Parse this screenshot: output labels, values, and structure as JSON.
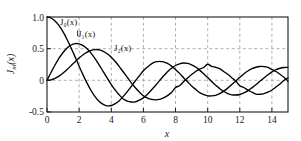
{
  "chart_data": {
    "type": "line",
    "title": "",
    "subtitle": "",
    "xlabel": "x",
    "ylabel": "J_m(x)",
    "xlim": [
      0,
      15
    ],
    "ylim": [
      -0.5,
      1.0
    ],
    "grid": true,
    "grid_style": "dashed",
    "legend": "inline-annotations",
    "xticks": [
      0,
      2,
      4,
      6,
      8,
      10,
      12,
      14
    ],
    "xticklabels": [
      "0",
      "2",
      "4",
      "6",
      "8",
      "10",
      "12",
      "14"
    ],
    "yticks": [
      -0.5,
      0,
      0.5,
      1.0
    ],
    "yticklabels": [
      "-0.5",
      "0",
      "0.5",
      "1.0"
    ],
    "x": [
      0,
      0.25,
      0.5,
      0.75,
      1,
      1.25,
      1.5,
      1.75,
      2,
      2.25,
      2.5,
      2.75,
      3,
      3.25,
      3.5,
      3.75,
      4,
      4.25,
      4.5,
      4.75,
      5,
      5.25,
      5.5,
      5.75,
      6,
      6.25,
      6.5,
      6.75,
      7,
      7.25,
      7.5,
      7.75,
      8,
      8.25,
      8.5,
      8.75,
      9,
      9.25,
      9.5,
      9.75,
      10,
      10.25,
      10.5,
      10.75,
      11,
      11.25,
      11.5,
      11.75,
      12,
      12.25,
      12.5,
      12.75,
      13,
      13.25,
      13.5,
      13.75,
      14,
      14.25,
      14.5,
      14.75,
      15
    ],
    "series": [
      {
        "name": "J0(x)",
        "label": "J₀(x)",
        "color": "#000000",
        "values": [
          1.0,
          0.9844,
          0.9385,
          0.8642,
          0.7652,
          0.6459,
          0.5118,
          0.369,
          0.2239,
          0.0827,
          -0.0484,
          -0.1641,
          -0.2601,
          -0.3337,
          -0.3801,
          -0.4026,
          -0.3971,
          -0.3665,
          -0.3205,
          -0.2526,
          -0.1776,
          -0.0968,
          -0.0068,
          0.0717,
          0.1506,
          0.2097,
          0.2601,
          0.2921,
          0.3001,
          0.2921,
          0.2663,
          0.2248,
          0.1717,
          0.1096,
          0.0419,
          -0.0232,
          -0.0903,
          -0.1424,
          -0.1939,
          -0.2243,
          -0.2459,
          -0.2459,
          -0.2366,
          -0.2097,
          -0.1712,
          -0.1231,
          -0.0677,
          -0.0093,
          0.0477,
          0.1015,
          0.1469,
          0.1838,
          0.2069,
          0.2184,
          0.2167,
          0.2029,
          0.1711,
          0.1392,
          0.0958,
          0.0471,
          -0.0142
        ]
      },
      {
        "name": "J1(x)",
        "label": "J₁(x)",
        "color": "#000000",
        "values": [
          0.0,
          0.124,
          0.2423,
          0.3492,
          0.4401,
          0.5106,
          0.5579,
          0.5802,
          0.5767,
          0.5484,
          0.4971,
          0.4258,
          0.3391,
          0.2403,
          0.1374,
          0.0339,
          -0.066,
          -0.1538,
          -0.2311,
          -0.2942,
          -0.3276,
          -0.3419,
          -0.3414,
          -0.311,
          -0.2767,
          -0.2196,
          -0.1538,
          -0.0819,
          -0.0047,
          0.0693,
          0.1352,
          0.1913,
          0.2346,
          0.261,
          0.2731,
          0.2668,
          0.2453,
          0.2099,
          0.1613,
          0.1041,
          0.0435,
          -0.0184,
          -0.0789,
          -0.131,
          -0.1768,
          -0.2088,
          -0.2284,
          -0.232,
          -0.2234,
          -0.1992,
          -0.1655,
          -0.1192,
          -0.0703,
          -0.0152,
          0.038,
          0.0874,
          0.1334,
          0.1687,
          0.1907,
          0.2028,
          0.2051
        ]
      },
      {
        "name": "J2(x)",
        "label": "J₂(x)",
        "color": "#000000",
        "values": [
          0.0,
          0.0078,
          0.0306,
          0.0673,
          0.1149,
          0.1711,
          0.2321,
          0.294,
          0.3528,
          0.405,
          0.4461,
          0.4739,
          0.4861,
          0.4813,
          0.4586,
          0.4193,
          0.3641,
          0.2969,
          0.2178,
          0.1318,
          0.0466,
          -0.0389,
          -0.1173,
          -0.1846,
          -0.2429,
          -0.2792,
          -0.3009,
          -0.3075,
          -0.3014,
          -0.2768,
          -0.2406,
          -0.1937,
          -0.113,
          -0.0849,
          -0.0237,
          0.0351,
          0.0917,
          0.1389,
          0.1768,
          0.2031,
          0.2546,
          0.2196,
          0.2066,
          0.1836,
          0.139,
          0.0953,
          0.0426,
          -0.0118,
          -0.0849,
          -0.1127,
          -0.1547,
          -0.1864,
          -0.2177,
          -0.2194,
          -0.2091,
          -0.1861,
          -0.152,
          -0.106,
          -0.057,
          -0.0031,
          0.0416
        ]
      }
    ],
    "annotations": [
      {
        "text": "J₀(x)",
        "x_px": 60,
        "y_px": 25
      },
      {
        "text": "J₁(x)",
        "x_px": 78,
        "y_px": 36
      },
      {
        "text": "J₂(x)",
        "x_px": 114,
        "y_px": 50
      }
    ],
    "colors": {
      "curve": "#000000",
      "grid": "#9a9a9a",
      "frame": "#1a1a1a",
      "background": "#ffffff",
      "text": "#1a1a1a"
    }
  }
}
